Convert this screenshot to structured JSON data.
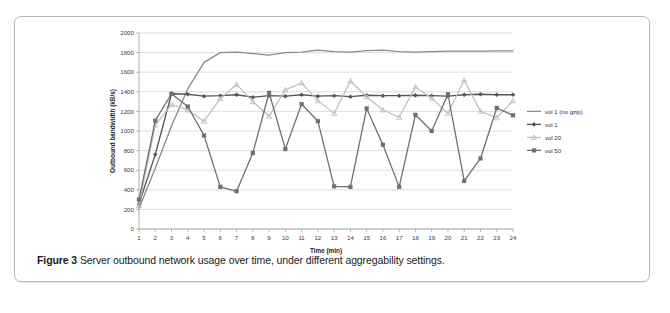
{
  "caption": {
    "label": "Figure 3",
    "text": "Server outbound network usage over time, under different aggregability settings."
  },
  "chart_data": {
    "type": "line",
    "title": "",
    "xlabel": "Time (min)",
    "ylabel": "Outbound bandwidth (kB/s)",
    "xlim": [
      1,
      24
    ],
    "ylim": [
      0,
      2000
    ],
    "ytick_step": 200,
    "yticks": [
      0,
      200,
      400,
      600,
      800,
      1000,
      1200,
      1400,
      1600,
      1800,
      2000
    ],
    "xticks": [
      1,
      2,
      3,
      4,
      5,
      6,
      7,
      8,
      9,
      10,
      11,
      12,
      13,
      14,
      15,
      16,
      17,
      18,
      19,
      20,
      21,
      22,
      23,
      24
    ],
    "grid": "horizontal",
    "legend_position": "right",
    "x": [
      1,
      2,
      3,
      4,
      5,
      6,
      7,
      8,
      9,
      10,
      11,
      12,
      13,
      14,
      15,
      16,
      17,
      18,
      19,
      20,
      21,
      22,
      23,
      24
    ],
    "series": [
      {
        "name": "vol 1 (no gzip)",
        "color": "#8a8a8a",
        "marker": "none",
        "width": 1.3,
        "values": [
          210,
          620,
          1050,
          1430,
          1700,
          1800,
          1805,
          1790,
          1775,
          1800,
          1805,
          1825,
          1810,
          1805,
          1820,
          1825,
          1810,
          1805,
          1810,
          1815,
          1815,
          1815,
          1818,
          1818
        ]
      },
      {
        "name": "vol 1",
        "color": "#555555",
        "marker": "diamond",
        "width": 1.3,
        "values": [
          255,
          760,
          1380,
          1375,
          1355,
          1360,
          1370,
          1345,
          1360,
          1355,
          1370,
          1355,
          1360,
          1350,
          1365,
          1360,
          1360,
          1365,
          1360,
          1355,
          1370,
          1375,
          1370,
          1370
        ]
      },
      {
        "name": "vol 20",
        "color": "#bdbdbd",
        "marker": "triangle",
        "width": 1.2,
        "values": [
          240,
          1060,
          1270,
          1215,
          1100,
          1330,
          1475,
          1300,
          1150,
          1420,
          1490,
          1310,
          1180,
          1510,
          1350,
          1215,
          1140,
          1450,
          1335,
          1180,
          1520,
          1200,
          1135,
          1310
        ]
      },
      {
        "name": "vol 50",
        "color": "#6f6f6f",
        "marker": "square",
        "width": 1.3,
        "values": [
          300,
          1105,
          1380,
          1250,
          955,
          430,
          385,
          775,
          1390,
          815,
          1275,
          1100,
          435,
          430,
          1230,
          860,
          430,
          1165,
          1000,
          1375,
          490,
          720,
          1235,
          1160
        ]
      }
    ]
  }
}
